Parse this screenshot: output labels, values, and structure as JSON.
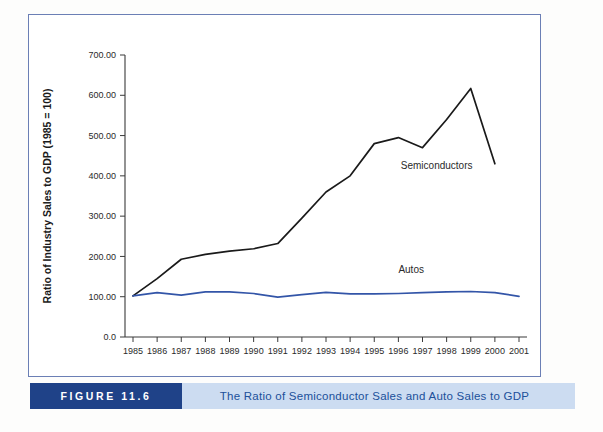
{
  "figure": {
    "number_label": "FIGURE 11.6",
    "caption": "The Ratio of Semiconductor Sales and Auto Sales to GDP",
    "accent_dark": "#1f4288",
    "accent_light": "#ccdcf1",
    "frame_color": "#6b7fb5"
  },
  "chart_data": {
    "type": "line",
    "title": "",
    "xlabel": "",
    "ylabel": "Ratio of Industry Sales to GDP (1985 = 100)",
    "categories": [
      "1985",
      "1986",
      "1987",
      "1988",
      "1989",
      "1990",
      "1991",
      "1992",
      "1993",
      "1994",
      "1995",
      "1996",
      "1997",
      "1998",
      "1999",
      "2000",
      "2001"
    ],
    "x": [
      1985,
      1986,
      1987,
      1988,
      1989,
      1990,
      1991,
      1992,
      1993,
      1994,
      1995,
      1996,
      1997,
      1998,
      1999,
      2000,
      2001
    ],
    "ylim": [
      0,
      700
    ],
    "xlim": [
      1985,
      2001
    ],
    "ytick_labels": [
      "0.0",
      "100.00",
      "200.00",
      "300.00",
      "400.00",
      "500.00",
      "600.00",
      "700.00"
    ],
    "ytick_values": [
      0,
      100,
      200,
      300,
      400,
      500,
      600,
      700
    ],
    "grid": false,
    "legend": "inline-annotations",
    "series": [
      {
        "name": "Semiconductors",
        "color": "#1a1a1a",
        "label_x": 1996.1,
        "label_y": 418,
        "values": [
          102,
          145,
          193,
          205,
          213,
          219,
          232,
          295,
          360,
          400,
          480,
          495,
          470,
          540,
          617,
          430,
          null
        ]
      },
      {
        "name": "Autos",
        "color": "#3355a8",
        "label_x": 1996.0,
        "label_y": 160,
        "values": [
          102,
          110,
          104,
          112,
          112,
          108,
          99,
          105,
          111,
          107,
          107,
          108,
          110,
          112,
          113,
          110,
          101
        ]
      }
    ],
    "series_x_overrides": {
      "Semiconductors": [
        1985,
        1986,
        1987,
        1988,
        1989,
        1990,
        1991,
        1992,
        1993,
        1994,
        1995,
        1996,
        1997,
        1998,
        1999,
        2000,
        2001
      ],
      "Autos": [
        1985,
        1986,
        1987,
        1988,
        1989,
        1990,
        1991,
        1992,
        1993,
        1994,
        1995,
        1996,
        1997,
        1998,
        1999,
        2000,
        2001
      ]
    },
    "semiconductor_points": [
      {
        "year": 1985,
        "value": 102
      },
      {
        "year": 1986,
        "value": 145
      },
      {
        "year": 1987,
        "value": 193
      },
      {
        "year": 1988,
        "value": 205
      },
      {
        "year": 1989,
        "value": 213
      },
      {
        "year": 1990,
        "value": 219
      },
      {
        "year": 1991,
        "value": 232
      },
      {
        "year": 1992,
        "value": 295
      },
      {
        "year": 1993,
        "value": 360
      },
      {
        "year": 1994,
        "value": 400
      },
      {
        "year": 1995,
        "value": 480
      },
      {
        "year": 1996,
        "value": 495
      },
      {
        "year": 1997,
        "value": 470
      },
      {
        "year": 1998,
        "value": 540
      },
      {
        "year": 1999,
        "value": 617
      },
      {
        "year": 2000,
        "value": 430
      }
    ],
    "auto_points": [
      {
        "year": 1985,
        "value": 102
      },
      {
        "year": 1986,
        "value": 110
      },
      {
        "year": 1987,
        "value": 104
      },
      {
        "year": 1988,
        "value": 112
      },
      {
        "year": 1989,
        "value": 112
      },
      {
        "year": 1990,
        "value": 108
      },
      {
        "year": 1991,
        "value": 99
      },
      {
        "year": 1992,
        "value": 105
      },
      {
        "year": 1993,
        "value": 111
      },
      {
        "year": 1994,
        "value": 107
      },
      {
        "year": 1995,
        "value": 107
      },
      {
        "year": 1996,
        "value": 108
      },
      {
        "year": 1997,
        "value": 110
      },
      {
        "year": 1998,
        "value": 112
      },
      {
        "year": 1999,
        "value": 113
      },
      {
        "year": 2000,
        "value": 110
      },
      {
        "year": 2001,
        "value": 101
      }
    ]
  }
}
